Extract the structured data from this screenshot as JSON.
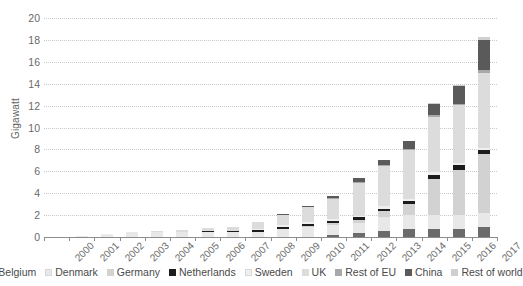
{
  "chart_data": {
    "type": "bar",
    "stacked": true,
    "title": "",
    "xlabel": "",
    "ylabel": "Gigawatt",
    "ylim": [
      0,
      20
    ],
    "ytick_step": 2,
    "yticks": [
      "0",
      "2",
      "4",
      "6",
      "8",
      "10",
      "12",
      "14",
      "16",
      "18",
      "20"
    ],
    "grid": true,
    "legend_position": "bottom",
    "categories": [
      "2000",
      "2001",
      "2002",
      "2003",
      "2004",
      "2005",
      "2006",
      "2007",
      "2008",
      "2009",
      "2010",
      "2011",
      "2012",
      "2013",
      "2014",
      "2015",
      "2016",
      "2017"
    ],
    "series": [
      {
        "name": "Belgium",
        "color": "#6b6b6b",
        "values": [
          0,
          0,
          0,
          0,
          0,
          0,
          0,
          0,
          0,
          0.03,
          0.03,
          0.19,
          0.38,
          0.57,
          0.71,
          0.71,
          0.71,
          0.88
        ]
      },
      {
        "name": "Denmark",
        "color": "#e8e8e8",
        "values": [
          0.03,
          0.05,
          0.21,
          0.42,
          0.42,
          0.42,
          0.42,
          0.42,
          0.42,
          0.66,
          0.87,
          0.87,
          0.92,
          1.27,
          1.27,
          1.27,
          1.27,
          1.27
        ]
      },
      {
        "name": "Germany",
        "color": "#d2d2d2",
        "values": [
          0,
          0,
          0,
          0,
          0,
          0,
          0,
          0,
          0,
          0.03,
          0.08,
          0.2,
          0.28,
          0.52,
          1.05,
          3.29,
          4.15,
          5.4
        ]
      },
      {
        "name": "Netherlands",
        "color": "#1c1c1c",
        "values": [
          0,
          0,
          0,
          0,
          0,
          0,
          0.1,
          0.1,
          0.22,
          0.22,
          0.22,
          0.22,
          0.22,
          0.22,
          0.22,
          0.42,
          0.42,
          0.42
        ]
      },
      {
        "name": "Sweden",
        "color": "#efefef",
        "values": [
          0,
          0,
          0.02,
          0.02,
          0.02,
          0.02,
          0.02,
          0.03,
          0.13,
          0.16,
          0.16,
          0.16,
          0.16,
          0.21,
          0.21,
          0.21,
          0.2,
          0.2
        ]
      },
      {
        "name": "UK",
        "color": "#dcdcdc",
        "values": [
          0,
          0.004,
          0.004,
          0.06,
          0.12,
          0.21,
          0.3,
          0.39,
          0.59,
          0.95,
          1.34,
          1.84,
          2.99,
          3.7,
          4.49,
          5.09,
          5.29,
          6.84
        ]
      },
      {
        "name": "Rest of EU",
        "color": "#a8a8a8",
        "values": [
          0,
          0,
          0,
          0,
          0,
          0,
          0,
          0,
          0,
          0,
          0,
          0.05,
          0.05,
          0.08,
          0.12,
          0.12,
          0.15,
          0.2
        ]
      },
      {
        "name": "China",
        "color": "#5a5a5a",
        "values": [
          0,
          0,
          0,
          0,
          0,
          0,
          0,
          0,
          0.02,
          0.08,
          0.14,
          0.24,
          0.39,
          0.43,
          0.66,
          1.02,
          1.63,
          2.79
        ]
      },
      {
        "name": "Rest of world",
        "color": "#cfcfcf",
        "values": [
          0,
          0,
          0,
          0,
          0,
          0,
          0,
          0,
          0,
          0,
          0,
          0,
          0,
          0.02,
          0.02,
          0.07,
          0.11,
          0.31
        ]
      }
    ],
    "totals": [
      "0.03",
      "0.05",
      "0.23",
      "0.5",
      "0.56",
      "0.65",
      "0.84",
      "0.94",
      "1.38",
      "2.13",
      "2.84",
      "3.57",
      "5.39",
      "7.02",
      "8.75",
      "12.2",
      "13.93",
      "18.31"
    ]
  },
  "legend": {
    "items": [
      {
        "label": "Belgium",
        "color": "#6b6b6b"
      },
      {
        "label": "Denmark",
        "color": "#e8e8e8"
      },
      {
        "label": "Germany",
        "color": "#d2d2d2"
      },
      {
        "label": "Netherlands",
        "color": "#1c1c1c"
      },
      {
        "label": "Sweden",
        "color": "#efefef"
      },
      {
        "label": "UK",
        "color": "#dcdcdc"
      },
      {
        "label": "Rest of EU",
        "color": "#a8a8a8"
      },
      {
        "label": "China",
        "color": "#5a5a5a"
      },
      {
        "label": "Rest of world",
        "color": "#cfcfcf"
      }
    ]
  },
  "axes": {
    "y_title": "Gigawatt"
  },
  "colors": {
    "gridline": "#c9c9c9",
    "axis": "#8c8c8c",
    "text": "#6a6a6a",
    "background": "#ffffff"
  }
}
